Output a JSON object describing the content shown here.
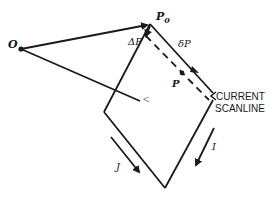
{
  "diagram": {
    "title": "",
    "labels": {
      "origin": "O",
      "p0": "P",
      "p0_sub": "0",
      "delta_p_big": "ΔP",
      "delta_p_small": "δP",
      "p": "P",
      "scanline_line1": "CURRENT",
      "scanline_line2": "SCANLINE",
      "i_dir": "I",
      "j_dir": "J",
      "corner_mark": "<"
    },
    "points": {
      "O": [
        21,
        49
      ],
      "P0": [
        150,
        24
      ],
      "left_vertex": [
        104,
        112
      ],
      "bottom_vertex": [
        165,
        188
      ],
      "right_vertex": [
        213,
        96
      ],
      "P": [
        183,
        74
      ]
    },
    "colors": {
      "stroke": "#1a1a1a",
      "background": "#ffffff"
    }
  }
}
